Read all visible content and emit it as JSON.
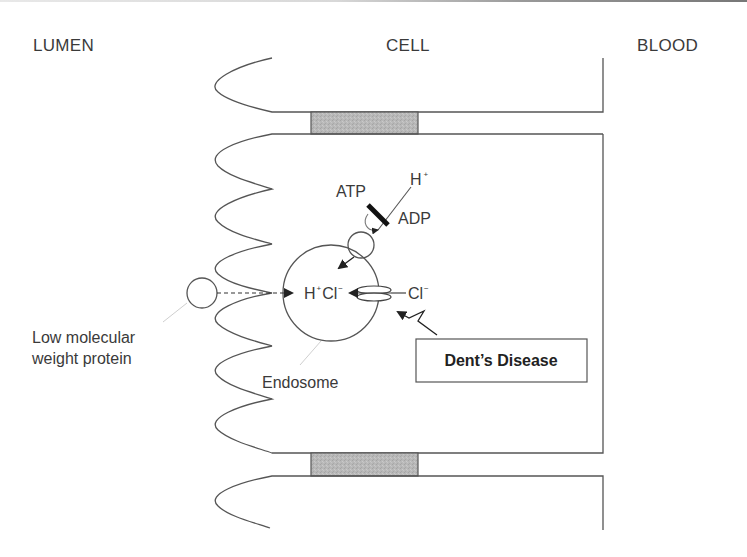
{
  "regions": {
    "lumen": "LUMEN",
    "cell": "CELL",
    "blood": "BLOOD"
  },
  "labels": {
    "atp": "ATP",
    "adp": "ADP",
    "h_ion": "H",
    "h_ion_charge": "+",
    "endosome_h": "H",
    "endosome_h_charge": "+",
    "endosome_cl": "Cl",
    "endosome_cl_charge": "−",
    "cl_ion": "Cl",
    "cl_ion_charge": "−",
    "protein_line1": "Low molecular",
    "protein_line2": "weight protein",
    "endosome": "Endosome",
    "disease": "Dent’s Disease"
  },
  "colors": {
    "line": "#555555",
    "junction_fill": "#b4b4b4",
    "text": "#3a3a3a",
    "background": "#ffffff"
  }
}
